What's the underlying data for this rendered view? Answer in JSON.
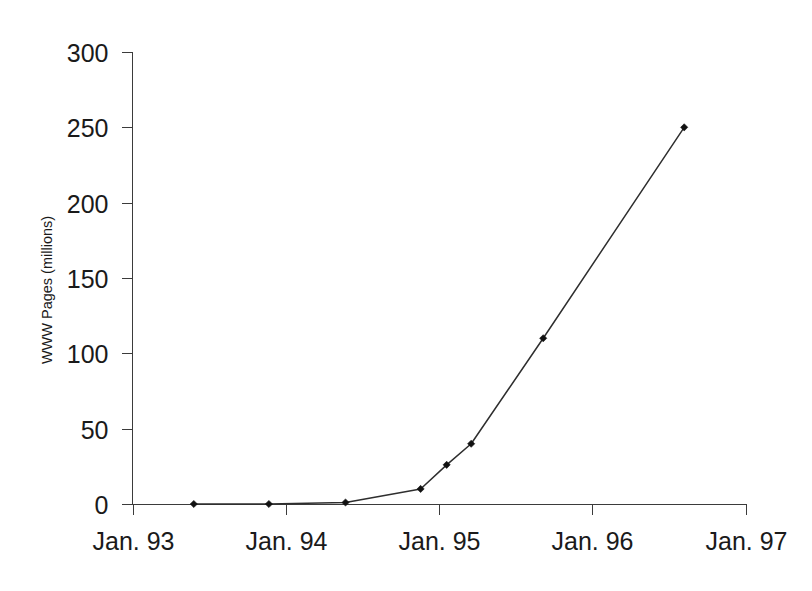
{
  "chart_data": {
    "type": "line",
    "title": "",
    "xlabel": "",
    "ylabel": "WWW Pages (millions)",
    "x": [
      "Jul. 93",
      "Nov. 93",
      "Apr. 94",
      "Sep. 94",
      "Jan. 95",
      "Mar. 95",
      "Aug. 95",
      "Sep. 96"
    ],
    "values": [
      0,
      0,
      1,
      10,
      26,
      40,
      110,
      250
    ],
    "points": [
      {
        "x_date": "Jul. 93",
        "x_year": 1993.4,
        "y": 0
      },
      {
        "x_date": "Nov. 93",
        "x_year": 1993.89,
        "y": 0
      },
      {
        "x_date": "Apr. 94",
        "x_year": 1994.39,
        "y": 1
      },
      {
        "x_date": "Sep. 94",
        "x_year": 1994.88,
        "y": 10
      },
      {
        "x_date": "Jan. 95",
        "x_year": 1995.05,
        "y": 26
      },
      {
        "x_date": "Mar. 95",
        "x_year": 1995.21,
        "y": 40
      },
      {
        "x_date": "Aug. 95",
        "x_year": 1995.68,
        "y": 110
      },
      {
        "x_date": "Sep. 96",
        "x_year": 1996.6,
        "y": 250
      }
    ],
    "xlim": [
      1993,
      1997
    ],
    "ylim": [
      0,
      300
    ],
    "xticks": [
      "Jan. 93",
      "Jan. 94",
      "Jan. 95",
      "Jan. 96",
      "Jan. 97"
    ],
    "xtick_values": [
      1993,
      1994,
      1995,
      1996,
      1997
    ],
    "yticks": [
      "0",
      "50",
      "100",
      "150",
      "200",
      "250",
      "300"
    ],
    "ytick_values": [
      0,
      50,
      100,
      150,
      200,
      250,
      300
    ],
    "grid": false,
    "legend": null,
    "marker": "diamond",
    "line_color": "#2e2e2e",
    "marker_color": "#111111",
    "axis_color": "#3b3b3b",
    "background_color": "#ffffff"
  }
}
